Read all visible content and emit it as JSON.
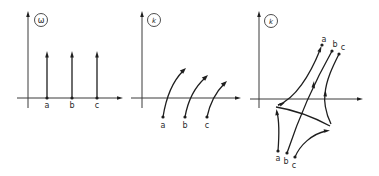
{
  "figure": {
    "panels": [
      {
        "id": "omega-plane",
        "plane_label": "ω",
        "point_labels": {
          "a": "a",
          "b": "b",
          "c": "c"
        }
      },
      {
        "id": "k-plane-1",
        "plane_label": "k",
        "point_labels": {
          "a": "a",
          "b": "b",
          "c": "c"
        }
      },
      {
        "id": "k-plane-2",
        "plane_label": "k",
        "point_labels_top": {
          "a": "a",
          "b": "b",
          "c": "c"
        },
        "point_labels_bottom": {
          "a": "a",
          "b": "b",
          "c": "c"
        }
      }
    ],
    "colors": {
      "background": "#ffffff",
      "ink": "#1e1e1e",
      "axis": "#3a3a3a"
    }
  }
}
